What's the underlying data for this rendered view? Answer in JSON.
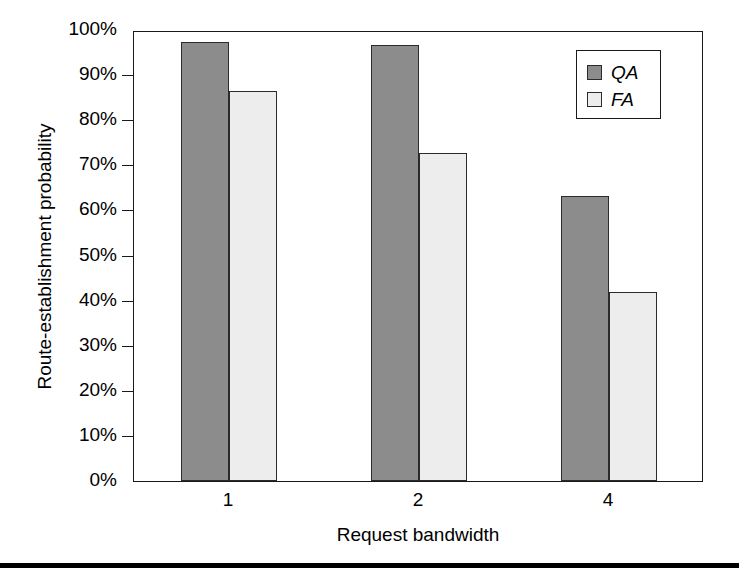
{
  "chart_data": {
    "type": "bar",
    "title": "",
    "xlabel": "Request bandwidth",
    "ylabel": "Route-establishment probability",
    "categories": [
      "1",
      "2",
      "4"
    ],
    "series": [
      {
        "name": "QA",
        "values": [
          97.3,
          96.6,
          63.3
        ],
        "color": "#8c8c8c"
      },
      {
        "name": "FA",
        "values": [
          86.4,
          72.7,
          41.9
        ],
        "color": "#ededed"
      }
    ],
    "ylim": [
      0,
      100
    ],
    "yticks": [
      0,
      10,
      20,
      30,
      40,
      50,
      60,
      70,
      80,
      90,
      100
    ],
    "ytick_labels": [
      "0%",
      "10%",
      "20%",
      "30%",
      "40%",
      "50%",
      "60%",
      "70%",
      "80%",
      "90%",
      "100%"
    ],
    "grid": false,
    "legend_position": "upper-right",
    "legend_entries": [
      "QA",
      "FA"
    ]
  },
  "figure": {
    "axis_color": "#1a1a1a",
    "background": "#ffffff",
    "bottom_rule_color": "#000000"
  }
}
